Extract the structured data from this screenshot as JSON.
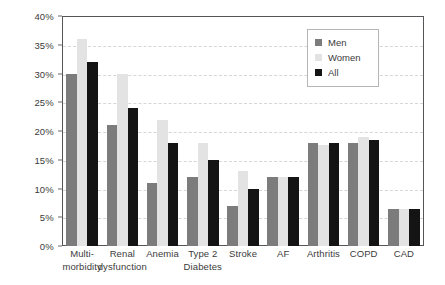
{
  "chart_data": {
    "type": "bar",
    "title": "",
    "subtitle": "",
    "xlabel": "",
    "ylabel": "",
    "ylim": [
      0,
      40
    ],
    "y_unit": "%",
    "grid": true,
    "grid_style": "dashed horizontal",
    "legend_position": "top-right inside plot",
    "categories": [
      "Multi-morbidity",
      "Renal dysfunction",
      "Anemia",
      "Type 2 Diabetes",
      "Stroke",
      "AF",
      "Arthritis",
      "COPD",
      "CAD"
    ],
    "category_lines": [
      [
        "Multi-",
        "morbidity"
      ],
      [
        "Renal",
        "dysfunction"
      ],
      [
        "Anemia",
        ""
      ],
      [
        "Type 2",
        "Diabetes"
      ],
      [
        "Stroke",
        ""
      ],
      [
        "AF",
        ""
      ],
      [
        "Arthritis",
        ""
      ],
      [
        "COPD",
        ""
      ],
      [
        "CAD",
        ""
      ]
    ],
    "series": [
      {
        "name": "Men",
        "color": "#7c7c7c",
        "values": [
          30,
          21,
          11,
          12,
          7,
          12,
          18,
          18,
          6.5
        ]
      },
      {
        "name": "Women",
        "color": "#e3e3e3",
        "values": [
          36,
          30,
          22,
          18,
          13,
          12,
          17.5,
          19,
          6.5
        ]
      },
      {
        "name": "All",
        "color": "#141414",
        "values": [
          32,
          24,
          18,
          15,
          10,
          12,
          18,
          18.5,
          6.5
        ]
      }
    ],
    "yticks": [
      {
        "value": 0,
        "label": "0%"
      },
      {
        "value": 5,
        "label": "5%"
      },
      {
        "value": 10,
        "label": "10%"
      },
      {
        "value": 15,
        "label": "15%"
      },
      {
        "value": 20,
        "label": "20%"
      },
      {
        "value": 25,
        "label": "25%"
      },
      {
        "value": 30,
        "label": "30%"
      },
      {
        "value": 35,
        "label": "35%"
      },
      {
        "value": 40,
        "label": "40%"
      }
    ]
  },
  "legend": {
    "items": [
      {
        "label": "Men",
        "key": "men"
      },
      {
        "label": "Women",
        "key": "women"
      },
      {
        "label": "All",
        "key": "all"
      }
    ]
  }
}
